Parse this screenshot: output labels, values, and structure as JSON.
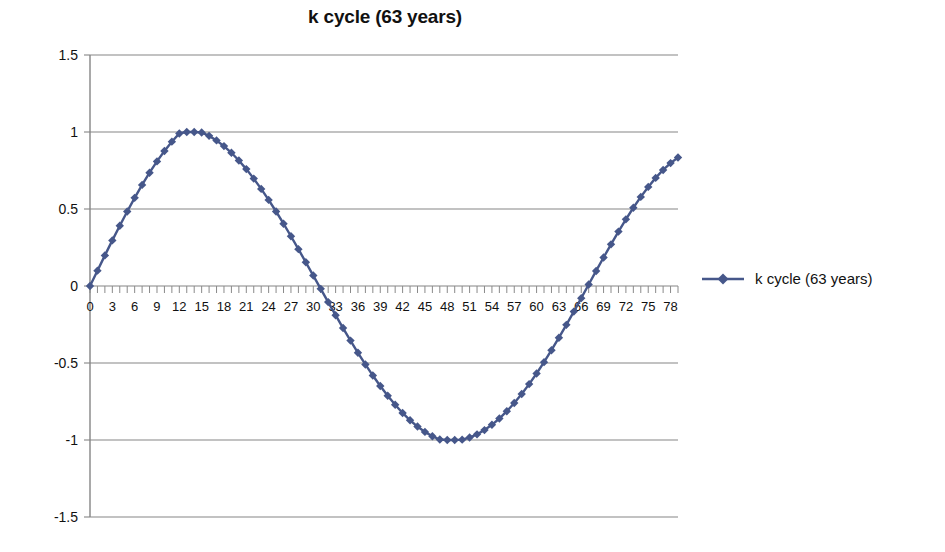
{
  "chart_data": {
    "type": "line",
    "title": "k cycle (63 years)",
    "xlabel": "",
    "ylabel": "",
    "legend": [
      "k cycle (63 years)"
    ],
    "legend_position": "right",
    "grid": true,
    "series_color": "#46578a",
    "marker": "diamond",
    "xlim": [
      0,
      79
    ],
    "ylim": [
      -1.5,
      1.5
    ],
    "yticks": [
      "1.5",
      "1",
      "0.5",
      "0",
      "-0.5",
      "-1",
      "-1.5"
    ],
    "ytick_values": [
      1.5,
      1,
      0.5,
      0,
      -0.5,
      -1,
      -1.5
    ],
    "xticks": [
      "0",
      "3",
      "6",
      "9",
      "12",
      "15",
      "18",
      "21",
      "24",
      "27",
      "30",
      "33",
      "36",
      "39",
      "42",
      "45",
      "48",
      "51",
      "54",
      "57",
      "60",
      "63",
      "66",
      "69",
      "72",
      "75",
      "78"
    ],
    "xtick_values": [
      0,
      3,
      6,
      9,
      12,
      15,
      18,
      21,
      24,
      27,
      30,
      33,
      36,
      39,
      42,
      45,
      48,
      51,
      54,
      57,
      60,
      63,
      66,
      69,
      72,
      75,
      78
    ],
    "x_tick_step": 3,
    "minor_tick_step": 1,
    "period_years": 63,
    "amplitude": 1,
    "formula": "sin(2*pi*x/63)",
    "x": [
      0,
      1,
      2,
      3,
      4,
      5,
      6,
      7,
      8,
      9,
      10,
      11,
      12,
      13,
      14,
      15,
      16,
      17,
      18,
      19,
      20,
      21,
      22,
      23,
      24,
      25,
      26,
      27,
      28,
      29,
      30,
      31,
      32,
      33,
      34,
      35,
      36,
      37,
      38,
      39,
      40,
      41,
      42,
      43,
      44,
      45,
      46,
      47,
      48,
      49,
      50,
      51,
      52,
      53,
      54,
      55,
      56,
      57,
      58,
      59,
      60,
      61,
      62,
      63,
      64,
      65,
      66,
      67,
      68,
      69,
      70,
      71,
      72,
      73,
      74,
      75,
      76,
      77,
      78,
      79
    ],
    "values": [
      0,
      0.0997,
      0.1987,
      0.2962,
      0.3915,
      0.4838,
      0.5724,
      0.6565,
      0.7357,
      0.8092,
      0.8765,
      0.9372,
      0.9907,
      1.0,
      1.0,
      0.9972,
      0.9749,
      0.9453,
      0.9086,
      0.8651,
      0.8151,
      0.7591,
      0.6974,
      0.6306,
      0.5591,
      0.4837,
      0.4047,
      0.323,
      0.2392,
      0.1539,
      0.0678,
      -0.0184,
      -0.1044,
      -0.1895,
      -0.273,
      -0.3546,
      -0.4336,
      -0.5094,
      -0.5816,
      -0.6496,
      -0.7131,
      -0.7715,
      -0.8245,
      -0.8717,
      -0.9128,
      -0.9475,
      -0.9755,
      -0.9966,
      -1.0,
      -1.0,
      -0.9978,
      -0.984,
      -0.9633,
      -0.9356,
      -0.9013,
      -0.8604,
      -0.8132,
      -0.7601,
      -0.7012,
      -0.637,
      -0.5679,
      -0.4944,
      -0.4169,
      -0.336,
      -0.2523,
      -0.1663,
      -0.0788,
      0.0096,
      0.0978,
      0.185,
      0.2705,
      0.3534,
      0.4329,
      0.5082,
      0.5786,
      0.6434,
      0.702,
      0.7537,
      0.7982,
      0.8349
    ]
  },
  "legend_entry": {
    "label": "k cycle (63 years)",
    "marker_icon": "diamond-marker"
  }
}
